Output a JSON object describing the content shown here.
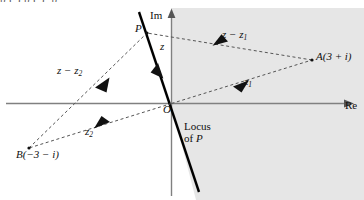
{
  "figure": {
    "type": "argand-diagram",
    "cut_off_text_above": "p              (   )                    p         (      ),          p",
    "axes": {
      "imaginary_label": "Im",
      "real_label": "Re",
      "origin_label": "O"
    },
    "points": [
      {
        "id": "A",
        "label": "A(3 + i)",
        "name": "point-a"
      },
      {
        "id": "B",
        "label": "B(−3 − i)",
        "name": "point-b"
      },
      {
        "id": "P",
        "label": "P",
        "name": "point-p"
      },
      {
        "id": "O",
        "label": "O",
        "name": "origin"
      }
    ],
    "vectors": [
      {
        "id": "z",
        "label_main": "z",
        "label_sub": "",
        "name": "vector-z"
      },
      {
        "id": "z1",
        "label_main": "z",
        "label_sub": "1",
        "name": "vector-z1"
      },
      {
        "id": "z2",
        "label_main": "z",
        "label_sub": "2",
        "name": "vector-z2"
      },
      {
        "id": "z_minus_z1",
        "label_main": "z − z",
        "label_sub": "1",
        "name": "vector-z-minus-z1"
      },
      {
        "id": "z_minus_z2",
        "label_main": "z − z",
        "label_sub": "2",
        "name": "vector-z-minus-z2"
      }
    ],
    "annotations": {
      "locus_line_1": "Locus",
      "locus_line_2": "of P",
      "locus_of_p": "Locus of P"
    },
    "colors": {
      "shaded_region": "#e6e6e6",
      "axis": "#808080",
      "locus_line": "#000000",
      "dashed_vector": "#555555",
      "text": "#111111"
    }
  }
}
